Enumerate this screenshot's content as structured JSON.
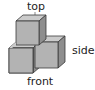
{
  "diagram": {
    "type": "isometric-cube-arrangement",
    "cube_count": 3,
    "labels": {
      "top": "top",
      "side": "side",
      "front": "front"
    },
    "colors": {
      "top_face": "#cbcbcb",
      "front_face": "#b3b3b3",
      "side_face": "#8e8e8e",
      "outline": "#3a3a3a"
    }
  }
}
